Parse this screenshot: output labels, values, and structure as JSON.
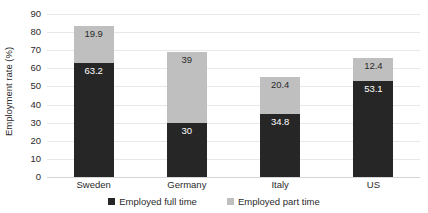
{
  "chart_data": {
    "type": "bar",
    "subtype": "stacked-bar",
    "title": "",
    "xlabel": "",
    "ylabel": "Employment rate (%)",
    "ylim": [
      0,
      90
    ],
    "ytick_step": 10,
    "yticks": [
      90,
      80,
      70,
      60,
      50,
      40,
      30,
      20,
      10,
      0
    ],
    "ytick_labels": [
      "90",
      "80",
      "70",
      "60",
      "50",
      "40",
      "30",
      "20",
      "10",
      "0"
    ],
    "grid": true,
    "grid_axis": "y",
    "legend_position": "bottom",
    "categories": [
      "Sweden",
      "Germany",
      "Italy",
      "US"
    ],
    "series": [
      {
        "name": "Employed full time",
        "color": "#262626",
        "values": [
          63.2,
          30,
          34.8,
          53.1
        ],
        "labels": [
          "63.2",
          "30",
          "34.8",
          "53.1"
        ]
      },
      {
        "name": "Employed part time",
        "color": "#bfbfbf",
        "values": [
          19.9,
          39,
          20.4,
          12.4
        ],
        "labels": [
          "19.9",
          "39",
          "20.4",
          "12.4"
        ]
      }
    ],
    "totals": [
      83.1,
      69,
      55.2,
      65.5
    ],
    "colors": {
      "full_time": "#262626",
      "part_time": "#bfbfbf",
      "gridline": "#e8e8e8",
      "text": "#2b2b2b",
      "background": "#ffffff"
    }
  },
  "legend": {
    "items": [
      {
        "label": "Employed full time",
        "swatch": "full"
      },
      {
        "label": "Employed part time",
        "swatch": "part"
      }
    ]
  }
}
